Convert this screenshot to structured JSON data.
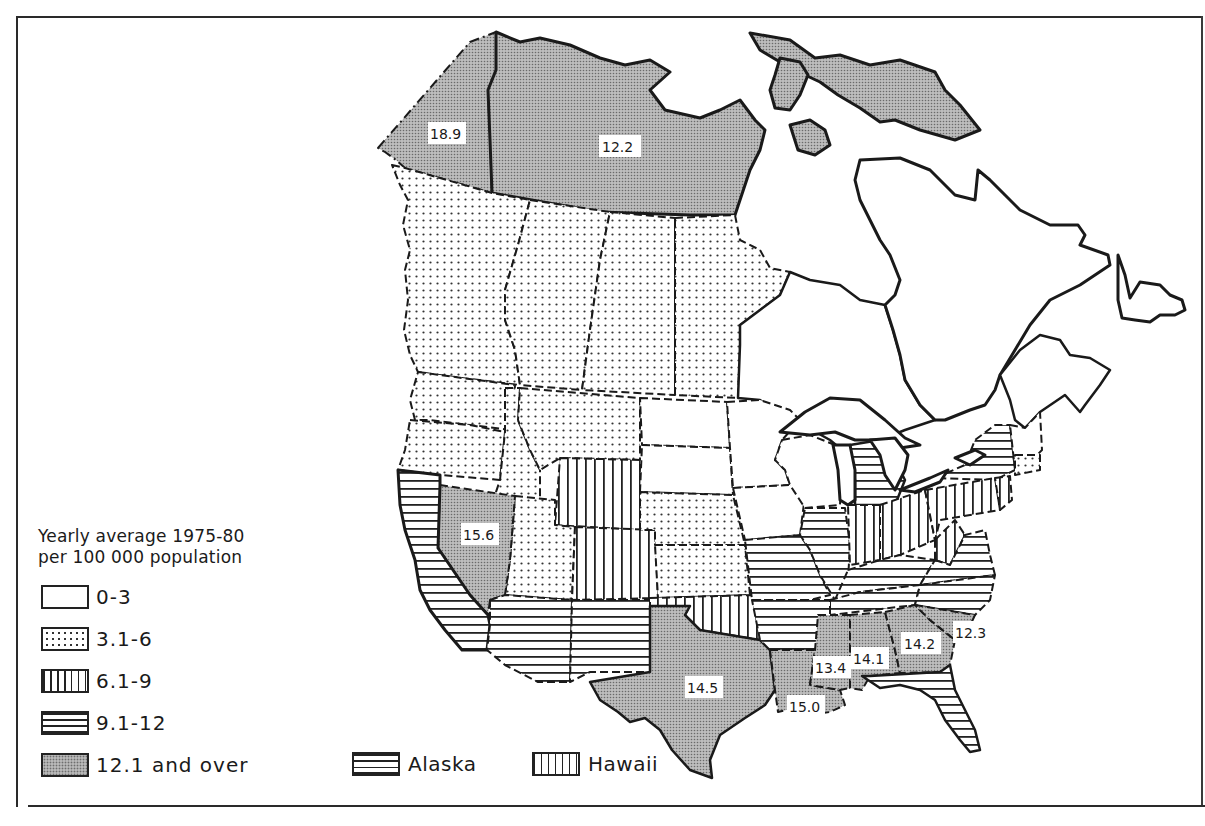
{
  "legend": {
    "title_line1": "Yearly average 1975-80",
    "title_line2": "per 100 000 population",
    "classes": [
      {
        "label": "0-3",
        "pattern": "blank"
      },
      {
        "label": "3.1-6",
        "pattern": "dotted"
      },
      {
        "label": "6.1-9",
        "pattern": "vertical-lines"
      },
      {
        "label": "9.1-12",
        "pattern": "horizontal-lines"
      },
      {
        "label": "12.1 and over",
        "pattern": "dense-stipple-gray"
      }
    ],
    "insets": [
      {
        "label": "Alaska",
        "pattern": "horizontal-lines"
      },
      {
        "label": "Hawaii",
        "pattern": "vertical-lines"
      }
    ]
  },
  "map": {
    "region": "Canada and United States",
    "region_labels": [
      {
        "region": "Yukon",
        "value": "18.9"
      },
      {
        "region": "Northwest Territories",
        "value": "12.2"
      },
      {
        "region": "Nevada",
        "value": "15.6"
      },
      {
        "region": "Texas",
        "value": "14.5"
      },
      {
        "region": "Louisiana",
        "value": "15.0"
      },
      {
        "region": "Mississippi",
        "value": "13.4"
      },
      {
        "region": "Alabama",
        "value": "14.1"
      },
      {
        "region": "Georgia",
        "value": "14.2"
      },
      {
        "region": "South Carolina",
        "value": "12.3"
      }
    ],
    "colors": {
      "ink": "#1a1a1a",
      "stipple_fill": "#b8b8b8",
      "background": "#ffffff"
    }
  }
}
